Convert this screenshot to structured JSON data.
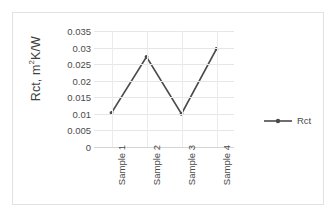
{
  "chart_data": {
    "type": "line",
    "title": "",
    "xlabel": "",
    "ylabel": "Rct, m2K/W",
    "ylabel_prefix": "Rct, m",
    "ylabel_sup": "2",
    "ylabel_suffix": "K/W",
    "categories": [
      "Sample 1",
      "Sample 2",
      "Sample 3",
      "Sample 4"
    ],
    "series": [
      {
        "name": "Rct",
        "values": [
          0.0103,
          0.0272,
          0.01,
          0.0296
        ]
      }
    ],
    "ylim": [
      0,
      0.035
    ],
    "yticks": [
      0,
      0.005,
      0.01,
      0.015,
      0.02,
      0.025,
      0.03,
      0.035
    ],
    "ytick_labels": [
      "0",
      "0.005",
      "0.01",
      "0.015",
      "0.02",
      "0.025",
      "0.03",
      "0.035"
    ],
    "grid": {
      "horizontal": true,
      "vertical": true
    },
    "legend": {
      "position": "right",
      "entries": [
        "Rct"
      ]
    },
    "colors": {
      "series_line": "#4a4a4a",
      "gridline": "#e6e6e6",
      "axis": "#d4d4d4",
      "border": "#e2e2e2",
      "text": "#4a4a4a",
      "background": "#ffffff"
    }
  }
}
